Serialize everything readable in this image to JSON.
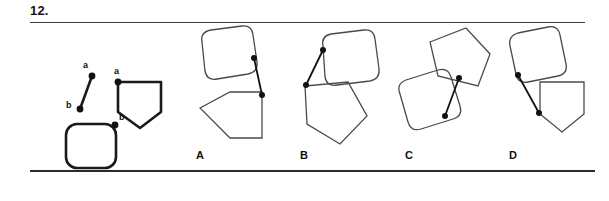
{
  "question": {
    "number": "12.",
    "type": "shape-assembly-spatial-reasoning"
  },
  "rules": {
    "top": true,
    "bottom": true
  },
  "prompt": {
    "name": "prompt-pieces",
    "pieces": [
      {
        "id": "connector-segment",
        "kind": "line-segment",
        "endpoints": [
          {
            "label": "a",
            "x": 68,
            "y": 52
          },
          {
            "label": "b",
            "x": 56,
            "y": 85
          }
        ]
      },
      {
        "id": "pentagon-piece",
        "kind": "pentagon-point-down",
        "marker": {
          "label": "a",
          "x": 94,
          "y": 58
        },
        "points": "94,58 137,58 137,88 116,104 94,88"
      },
      {
        "id": "rounded-square-piece",
        "kind": "rounded-square",
        "marker": {
          "label": "b",
          "x": 92,
          "y": 100
        },
        "rect": {
          "x": 42,
          "y": 100,
          "w": 50,
          "h": 44,
          "r": 11
        }
      }
    ],
    "labels": {
      "a": "a",
      "b": "b"
    }
  },
  "options": [
    {
      "key": "A",
      "label": "A",
      "name": "option-a",
      "square": {
        "path": "M 22,18 Q 20,8 31,6 L 62,2 Q 72,1 73,11 L 77,38 Q 78,48 68,50 L 37,55 Q 27,57 25,47 Z"
      },
      "polygon": {
        "points": "20,84 50,68 82,68 82,114 50,114"
      },
      "connector": {
        "x1": 74,
        "y1": 34,
        "x2": 82,
        "y2": 71
      },
      "joints": [
        {
          "x": 74,
          "y": 34
        },
        {
          "x": 82,
          "y": 71
        }
      ]
    },
    {
      "key": "B",
      "label": "B",
      "name": "option-b",
      "square": {
        "path": "M 38,22 Q 36,12 46,10 L 79,6 Q 89,5 90,15 L 94,45 Q 95,55 85,57 L 52,61 Q 42,63 40,53 Z"
      },
      "polygon": {
        "points": "20,62 63,58 82,92 55,120 22,100"
      },
      "connector": {
        "x1": 38,
        "y1": 26,
        "x2": 21,
        "y2": 61
      },
      "joints": [
        {
          "x": 38,
          "y": 26
        },
        {
          "x": 21,
          "y": 61
        }
      ]
    },
    {
      "key": "C",
      "label": "C",
      "name": "option-c",
      "square": {
        "path": "M 10,70 Q 6,60 16,56 L 48,46 Q 58,43 61,53 L 70,82 Q 73,92 63,95 L 31,105 Q 21,108 18,98 Z"
      },
      "polygon": {
        "points": "40,18 76,4 100,30 88,62 48,52"
      },
      "connector": {
        "x1": 69,
        "y1": 54,
        "x2": 55,
        "y2": 92
      },
      "joints": [
        {
          "x": 69,
          "y": 54
        },
        {
          "x": 55,
          "y": 92
        }
      ]
    },
    {
      "key": "D",
      "label": "D",
      "name": "option-d",
      "square": {
        "path": "M 18,22 Q 16,12 26,9 L 56,3 Q 66,1 68,11 L 74,40 Q 76,50 66,52 L 36,58 Q 26,60 24,50 Z"
      },
      "polygon": {
        "points": "48,58 92,58 92,90 70,108 48,90"
      },
      "connector": {
        "x1": 26,
        "y1": 51,
        "x2": 47,
        "y2": 89
      },
      "joints": [
        {
          "x": 26,
          "y": 51
        },
        {
          "x": 47,
          "y": 89
        }
      ]
    }
  ]
}
